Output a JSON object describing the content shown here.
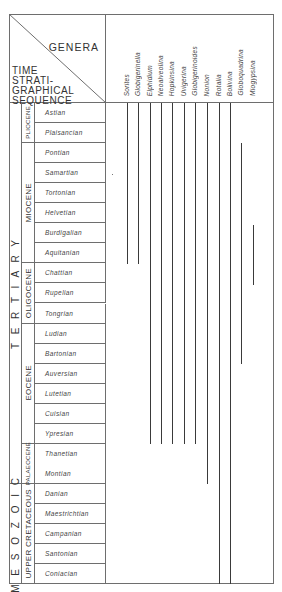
{
  "header": {
    "genera_title": "GENERA",
    "time_title_lines": [
      "TIME",
      "STRATI-",
      "GRAPHICAL",
      "SEQUENCE"
    ]
  },
  "eras": [
    {
      "label": "TERTIARY",
      "start_row": 0,
      "end_row": 19
    },
    {
      "label": "MESOZOIC",
      "start_row": 19,
      "end_row": 24
    }
  ],
  "epochs": [
    {
      "label": "PLIOCENE",
      "start_row": 0,
      "end_row": 2
    },
    {
      "label": "MIOCENE",
      "start_row": 2,
      "end_row": 8
    },
    {
      "label": "OLIGOCENE",
      "start_row": 8,
      "end_row": 11
    },
    {
      "label": "EOCENE",
      "start_row": 11,
      "end_row": 17
    },
    {
      "label": "PALAEOCENE",
      "start_row": 17,
      "end_row": 19
    },
    {
      "label": "UPPER CRETACEOUS",
      "start_row": 19,
      "end_row": 24
    }
  ],
  "stages": [
    "Astian",
    "Plaisancian",
    "Pontian",
    "Samartian",
    "Tortonian",
    "Helvetian",
    "Burdigalian",
    "Aquitanian",
    "Chattian",
    "Rupelian",
    "Tongrian",
    "Ludian",
    "Bartonian",
    "Auversian",
    "Lutetian",
    "Cuisian",
    "Ypresian",
    "Thanetian",
    "Montian",
    "Danian",
    "Maestrichtian",
    "Campanian",
    "Santonian",
    "Coniacian"
  ],
  "genera": [
    "Sorites",
    "Globigerinella",
    "Elphidium",
    "Neoalveolina",
    "Hopkinsina",
    "Uvigerina",
    "Globigerinoides",
    "Nonion",
    "Rotalia",
    "Bolivina",
    "Globoquadrina",
    "Miogypsina"
  ],
  "chart_data": {
    "type": "range-chart",
    "xlabel": "GENERA",
    "ylabel": "TIME STRATIGRAPHICAL SEQUENCE",
    "categories": [
      "Sorites",
      "Globigerinella",
      "Elphidium",
      "Neoalveolina",
      "Hopkinsina",
      "Uvigerina",
      "Globigerinoides",
      "Nonion",
      "Rotalia",
      "Bolivina",
      "Globoquadrina",
      "Miogypsina"
    ],
    "ranges": [
      {
        "genus": "Sorites",
        "from": "Astian",
        "to": "Burdigalian",
        "start_row": 0,
        "end_row": 8
      },
      {
        "genus": "Globigerinella",
        "from": "Astian",
        "to": "Burdigalian",
        "start_row": 0,
        "end_row": 8
      },
      {
        "genus": "Elphidium",
        "from": "Astian",
        "to": "Ypresian",
        "start_row": 0,
        "end_row": 17
      },
      {
        "genus": "Neoalveolina",
        "from": "Astian",
        "to": "Ypresian",
        "start_row": 0,
        "end_row": 17
      },
      {
        "genus": "Hopkinsina",
        "from": "Astian",
        "to": "Ypresian",
        "start_row": 0,
        "end_row": 17
      },
      {
        "genus": "Uvigerina",
        "from": "Astian",
        "to": "Ypresian",
        "start_row": 0,
        "end_row": 17
      },
      {
        "genus": "Globigerinoides",
        "from": "Astian",
        "to": "Ypresian",
        "start_row": 0,
        "end_row": 17
      },
      {
        "genus": "Nonion",
        "from": "Astian",
        "to": "Montian",
        "start_row": 0,
        "end_row": 19
      },
      {
        "genus": "Rotalia",
        "from": "Astian",
        "to": "Coniacian",
        "start_row": 0,
        "end_row": 24
      },
      {
        "genus": "Bolivina",
        "from": "Astian",
        "to": "Coniacian",
        "start_row": 0,
        "end_row": 24
      },
      {
        "genus": "Globoquadrina",
        "from": "Pontian",
        "to": "Tongrian",
        "start_row": 2,
        "end_row": 13
      },
      {
        "genus": "Miogypsina",
        "from": "Burdigalian",
        "to": "Chattian",
        "start_row": 6,
        "end_row": 9
      }
    ]
  }
}
